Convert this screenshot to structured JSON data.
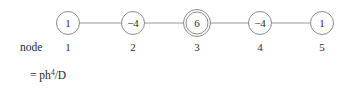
{
  "figure": {
    "row_label": "node",
    "formula": {
      "base": "= ph",
      "exponent": "4",
      "denominator": "/D"
    }
  },
  "chart_data": {
    "type": "diagram",
    "title": "",
    "subtitle": "",
    "row_label": "node",
    "formula": "= ph^4/D",
    "colors": {
      "stroke": "#7e7e7e",
      "edge": "#8a8a8a",
      "text": "#1f1f1f",
      "background": "#ffffff"
    },
    "node_indices": [
      "1",
      "2",
      "3",
      "4",
      "5"
    ],
    "node_values": [
      "1",
      "−4",
      "6",
      "−4",
      "1"
    ],
    "nodes": [
      {
        "index": "1",
        "value": "1",
        "cx": 68,
        "cy": 23,
        "r": 11.5,
        "double_ring": false
      },
      {
        "index": "2",
        "value": "−4",
        "cx": 133,
        "cy": 23,
        "r": 11.5,
        "double_ring": false
      },
      {
        "index": "3",
        "value": "6",
        "cx": 197,
        "cy": 23,
        "r": 11.0,
        "double_ring": true,
        "r_outer": 13.5
      },
      {
        "index": "4",
        "value": "−4",
        "cx": 260,
        "cy": 23,
        "r": 11.5,
        "double_ring": false
      },
      {
        "index": "5",
        "value": "1",
        "cx": 322,
        "cy": 23,
        "r": 11.5,
        "double_ring": false
      }
    ],
    "edges": [
      {
        "from": "1",
        "to": "2"
      },
      {
        "from": "2",
        "to": "3"
      },
      {
        "from": "3",
        "to": "4"
      },
      {
        "from": "4",
        "to": "5"
      }
    ],
    "label_row_y": 47,
    "formula_y": 75
  }
}
